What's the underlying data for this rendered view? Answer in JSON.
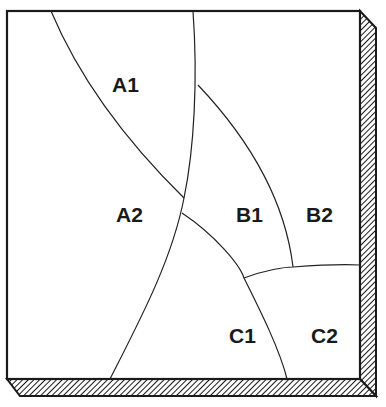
{
  "diagram": {
    "type": "partitioned-square-slab",
    "colors": {
      "background": "#ffffff",
      "line": "#222222",
      "label": "#1a1a1a",
      "hatch": "#1a1a1a"
    },
    "regions": [
      {
        "id": "A1",
        "label": "A1",
        "x": 112,
        "y": 92
      },
      {
        "id": "A2",
        "label": "A2",
        "x": 116,
        "y": 222
      },
      {
        "id": "B1",
        "label": "B1",
        "x": 236,
        "y": 222
      },
      {
        "id": "B2",
        "label": "B2",
        "x": 306,
        "y": 222
      },
      {
        "id": "C1",
        "label": "C1",
        "x": 229,
        "y": 343
      },
      {
        "id": "C2",
        "label": "C2",
        "x": 311,
        "y": 343
      }
    ]
  }
}
